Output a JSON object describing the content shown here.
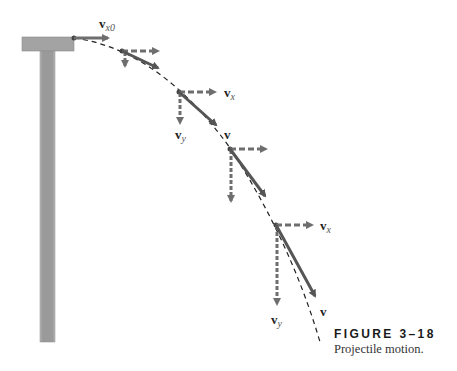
{
  "figure": {
    "number": "FIGURE 3–18",
    "caption": "Projectile motion."
  },
  "labels": {
    "vx0_main": "v",
    "vx0_sub": "x0",
    "vx_main": "v",
    "vx_sub": "x",
    "vy_main": "v",
    "vy_sub": "y",
    "v": "v"
  },
  "colors": {
    "arrow": "#6e6e6e",
    "pillar": "#9a9a9a",
    "trajectory": "#222222"
  },
  "points": [
    {
      "x": 74,
      "y": 38,
      "vx_end": 112,
      "vy_end": null,
      "v_end": [
        112,
        38
      ]
    },
    {
      "x": 122,
      "y": 51,
      "vx_end": 163,
      "vy_end": 70,
      "v_end": [
        162,
        70
      ]
    },
    {
      "x": 179,
      "y": 92,
      "vx_end": 220,
      "vy_end": 127,
      "v_end": [
        220,
        128
      ]
    },
    {
      "x": 230,
      "y": 149,
      "vx_end": 270,
      "vy_end": 205,
      "v_end": [
        268,
        200
      ]
    },
    {
      "x": 276,
      "y": 225,
      "vx_end": 316,
      "vy_end": 308,
      "v_end": [
        318,
        300
      ]
    }
  ]
}
